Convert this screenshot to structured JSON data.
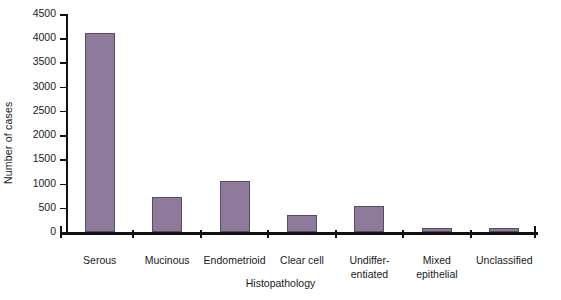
{
  "chart_data": {
    "type": "bar",
    "title": "",
    "xlabel": "Histopathology",
    "ylabel": "Number of cases",
    "categories": [
      "Serous",
      "Mucinous",
      "Endometrioid",
      "Clear cell",
      "Undiffer-\nentiated",
      "Mixed\nepithelial",
      "Unclassified"
    ],
    "values": [
      4100,
      730,
      1060,
      350,
      530,
      90,
      80
    ],
    "ylim": [
      0,
      4500
    ],
    "yticks": [
      0,
      500,
      1000,
      1500,
      2000,
      2500,
      3000,
      3500,
      4000,
      4500
    ],
    "ytick_labels": [
      "0",
      "500",
      "1000",
      "1500",
      "2000",
      "2500",
      "3000",
      "3500",
      "4000",
      "4500"
    ],
    "grid": false,
    "legend": false,
    "bar_color": "#8e7a9b",
    "bar_edge_color": "#584a63",
    "axis_color": "#111111"
  }
}
